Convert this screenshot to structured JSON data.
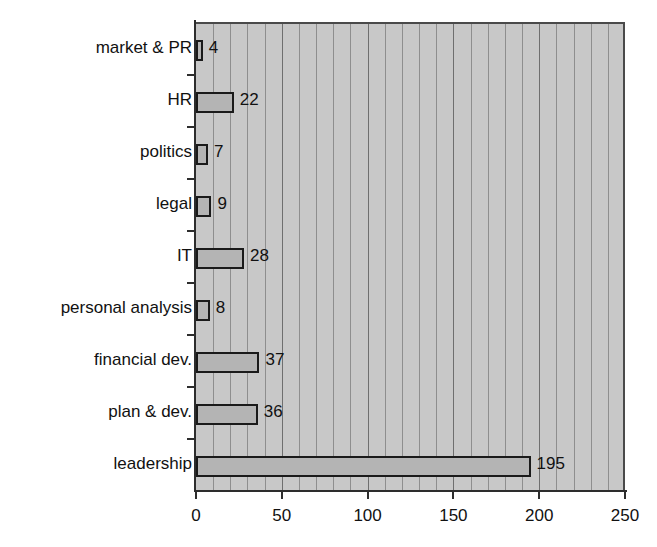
{
  "chart_data": {
    "type": "bar",
    "orientation": "horizontal",
    "title": "",
    "subtitle": "",
    "xlabel": "",
    "ylabel": "",
    "xlim": [
      0,
      250
    ],
    "ylim": null,
    "grid": true,
    "grid_axis": "x",
    "grid_minor_step": 10,
    "legend": null,
    "legend_position": "none",
    "categories": [
      "market & PR",
      "HR",
      "politics",
      "legal",
      "IT",
      "personal analysis",
      "financial dev.",
      "plan & dev.",
      "leadership"
    ],
    "values": [
      4,
      22,
      7,
      9,
      28,
      8,
      37,
      36,
      195
    ],
    "data_labels": [
      "4",
      "22",
      "7",
      "9",
      "28",
      "8",
      "37",
      "36",
      "195"
    ],
    "xticks": [
      0,
      50,
      100,
      150,
      200,
      250
    ],
    "xtick_labels": [
      "0",
      "50",
      "100",
      "150",
      "200",
      "250"
    ],
    "colors": {
      "plot_background": "#c8c8c8",
      "bar_fill": "#b4b4b4",
      "bar_edge": "#1a1a1a",
      "gridline": "#8e8e8e",
      "gridline_major": "#6f6f6f",
      "axis": "#2d2d2d",
      "text": "#111111",
      "page_background": "#ffffff"
    }
  }
}
